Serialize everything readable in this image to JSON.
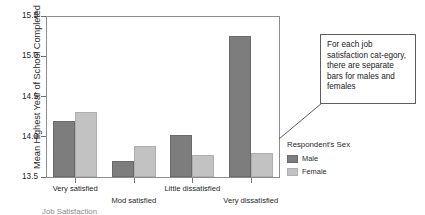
{
  "chart_data": {
    "type": "bar",
    "title": "",
    "xlabel": "Job Satisfaction",
    "ylabel": "Mean Highest Year of School Completed",
    "categories": [
      "Very satisfied",
      "Mod satisfied",
      "Little dissatisfied",
      "Very dissatisfied"
    ],
    "series": [
      {
        "name": "Male",
        "color": "#7d7d7d",
        "values": [
          14.2,
          13.7,
          14.02,
          15.25
        ]
      },
      {
        "name": "Female",
        "color": "#c2c2c2",
        "values": [
          14.31,
          13.89,
          13.77,
          13.8
        ]
      }
    ],
    "ylim": [
      13.5,
      15.5
    ],
    "yticks": [
      13.5,
      14.0,
      14.5,
      15.0,
      15.5
    ],
    "ytick_labels": [
      "13.5",
      "14.0",
      "14.5",
      "15.0",
      "15.5"
    ],
    "grid": false,
    "legend_position": "right"
  },
  "axes": {
    "y_title": "Mean Highest Year of School Completed",
    "x_title": "Job Satisfaction"
  },
  "legend": {
    "title": "Respondent's Sex",
    "entries": [
      {
        "label": "Male",
        "color": "#7d7d7d"
      },
      {
        "label": "Female",
        "color": "#c2c2c2"
      }
    ]
  },
  "callout": {
    "text": "For each job satisfaction cat-egory, there are separate bars for males and females"
  }
}
